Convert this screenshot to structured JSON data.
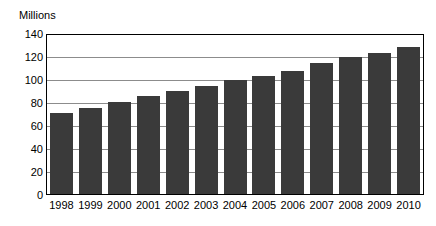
{
  "chart_data": {
    "type": "bar",
    "title": "",
    "subtitle": "",
    "xlabel": "",
    "ylabel": "Millions",
    "ylim": [
      0,
      140
    ],
    "ytick_step": 20,
    "yticks": [
      0,
      20,
      40,
      60,
      80,
      100,
      120,
      140
    ],
    "ytick_labels": [
      "0",
      "20",
      "40",
      "60",
      "80",
      "100",
      "120",
      "140"
    ],
    "grid": true,
    "grid_axis": "y",
    "legend": false,
    "legend_position": "none",
    "categories": [
      "1998",
      "1999",
      "2000",
      "2001",
      "2002",
      "2003",
      "2004",
      "2005",
      "2006",
      "2007",
      "2008",
      "2009",
      "2010"
    ],
    "values": [
      71,
      76,
      81,
      86,
      91,
      95,
      100,
      104,
      108,
      115,
      121,
      124,
      129
    ],
    "series": [
      {
        "name": "Millions",
        "values": [
          71,
          76,
          81,
          86,
          91,
          95,
          100,
          104,
          108,
          115,
          121,
          124,
          129
        ]
      }
    ],
    "colors": {
      "bar": "#3a3a3a",
      "gridline": "#8c8c8c",
      "frame": "#000000",
      "background": "#ffffff",
      "text": "#000000"
    }
  }
}
